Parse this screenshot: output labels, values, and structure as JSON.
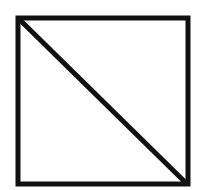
{
  "diagram": {
    "shape": "square-with-diagonal",
    "stroke_color": "#111111",
    "background": "#ffffff",
    "square": {
      "x": 18,
      "y": 18,
      "width": 170,
      "height": 166,
      "stroke_width": 5
    },
    "diagonal": {
      "x1": 19,
      "y1": 19,
      "x2": 186,
      "y2": 183,
      "stroke_width": 5
    }
  }
}
